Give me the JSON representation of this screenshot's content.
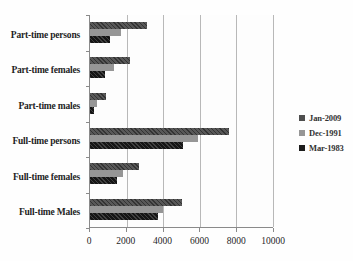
{
  "chart_data": {
    "type": "bar",
    "orientation": "horizontal",
    "title": "",
    "xlabel": "",
    "ylabel": "",
    "categories": [
      "Part-time persons",
      "Part-time females",
      "Part-time males",
      "Full-time persons",
      "Full-time females",
      "Full-time Males"
    ],
    "series": [
      {
        "name": "Jan-2009",
        "color": "#4e4e4e",
        "values": [
          3100,
          2200,
          900,
          7600,
          2700,
          5000
        ]
      },
      {
        "name": "Dec-1991",
        "color": "#969696",
        "values": [
          1700,
          1300,
          400,
          5900,
          1800,
          4000
        ]
      },
      {
        "name": "Mar-1983",
        "color": "#1c1c1c",
        "values": [
          1100,
          800,
          200,
          5100,
          1500,
          3700
        ]
      }
    ],
    "xlim": [
      0,
      10000
    ],
    "x_ticks": [
      0,
      2000,
      4000,
      6000,
      8000,
      10000
    ],
    "x_tick_labels": [
      "0",
      "2000",
      "4000",
      "6000",
      "8000",
      "10000"
    ],
    "grid": true,
    "legend_position": "right"
  },
  "colors": {
    "axis": "#8a8a8a",
    "gridline": "#b8b8b8",
    "text": "#1f1f1f"
  }
}
